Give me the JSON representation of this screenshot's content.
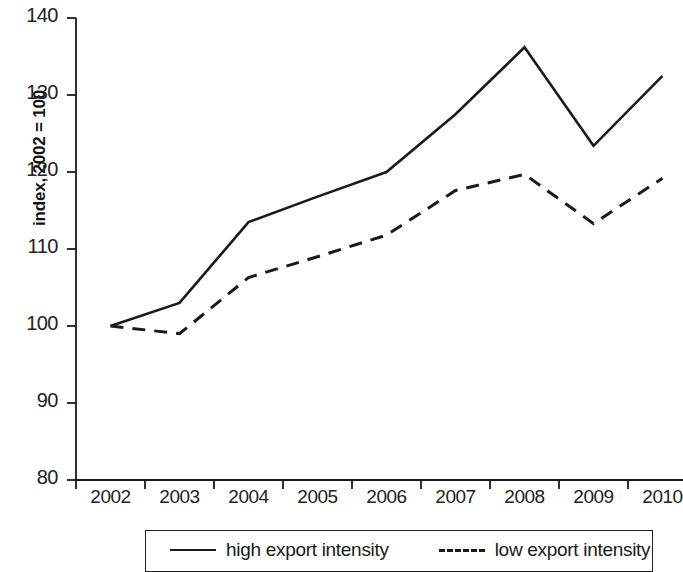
{
  "chart_data": {
    "type": "line",
    "title": "",
    "xlabel": "",
    "ylabel": "index, 2002 = 100",
    "categories": [
      "2002",
      "2003",
      "2004",
      "2005",
      "2006",
      "2007",
      "2008",
      "2009",
      "2010"
    ],
    "x": [
      2002,
      2003,
      2004,
      2005,
      2006,
      2007,
      2008,
      2009,
      2010
    ],
    "series": [
      {
        "name": "high export intensity",
        "style": "solid",
        "color": "#1a1a1a",
        "values": [
          100.0,
          103.0,
          113.5,
          116.8,
          120.0,
          127.5,
          136.2,
          123.4,
          132.5
        ]
      },
      {
        "name": "low export intensity",
        "style": "dashed",
        "color": "#1a1a1a",
        "values": [
          100.0,
          99.0,
          106.3,
          109.0,
          111.8,
          117.6,
          119.7,
          113.3,
          119.2
        ]
      }
    ],
    "ylim": [
      80,
      140
    ],
    "yticks": [
      80,
      90,
      100,
      110,
      120,
      130,
      140
    ],
    "ytick_labels": [
      "80",
      "90",
      "100",
      "110",
      "120",
      "130",
      "140"
    ],
    "xtick_labels": [
      "2002",
      "2003",
      "2004",
      "2005",
      "2006",
      "2007",
      "2008",
      "2009",
      "2010"
    ],
    "grid": false,
    "legend_position": "bottom",
    "legend": [
      {
        "label": "high export intensity",
        "style": "solid"
      },
      {
        "label": "low export intensity",
        "style": "dashed"
      }
    ]
  }
}
